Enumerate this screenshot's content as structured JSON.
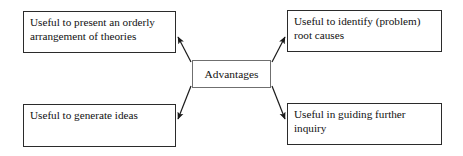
{
  "diagram": {
    "type": "radial-concept-map",
    "center": {
      "id": "hub",
      "label": "Advantages"
    },
    "branches": [
      {
        "id": "top-left",
        "label": "Useful to present an orderly arrangement of theories",
        "direction": "up-left"
      },
      {
        "id": "top-right",
        "label": "Useful to identify (problem) root causes",
        "direction": "up-right"
      },
      {
        "id": "bottom-left",
        "label": "Useful to generate ideas",
        "direction": "down-left"
      },
      {
        "id": "bottom-right",
        "label": "Useful in guiding further inquiry",
        "direction": "down-right"
      }
    ],
    "colors": {
      "background": "#ffffff",
      "leaf_border": "#2b2b2b",
      "hub_border": "#6f6f6f",
      "connector": "#1a1a1a",
      "text": "#111111"
    }
  }
}
